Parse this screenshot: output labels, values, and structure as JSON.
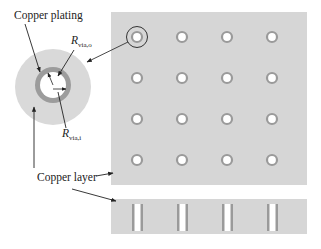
{
  "labels": {
    "copper_plating": "Copper plating",
    "copper_layer": "Copper layer",
    "r_via_o_main": "R",
    "r_via_o_sub": "via,o",
    "r_via_i_main": "R",
    "r_via_i_sub": "via,i"
  },
  "colors": {
    "copper_layer_fill": "#d6d6d6",
    "plating_ring": "#9a9a9a",
    "hole": "#ffffff",
    "line": "#333333",
    "text": "#222222"
  },
  "grid": {
    "rows": 4,
    "cols": 4,
    "col_x": [
      137,
      182,
      227,
      272
    ],
    "row_y": [
      37,
      78,
      119,
      160
    ]
  }
}
